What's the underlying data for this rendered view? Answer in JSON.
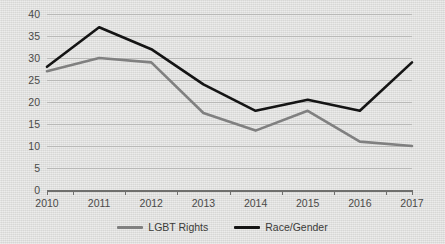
{
  "chart_data": {
    "type": "line",
    "title": "",
    "xlabel": "",
    "ylabel": "",
    "categories": [
      "2010",
      "2011",
      "2012",
      "2013",
      "2014",
      "2015",
      "2016",
      "2017"
    ],
    "series": [
      {
        "name": "LGBT Rights",
        "color": "#808080",
        "values": [
          27,
          30,
          29,
          17.5,
          13.5,
          18,
          11,
          10
        ]
      },
      {
        "name": "Race/Gender",
        "color": "#141414",
        "values": [
          28,
          37,
          32,
          24,
          18,
          20.5,
          18,
          29
        ]
      }
    ],
    "ylim": [
      0,
      40
    ],
    "ytick_labels": [
      "0",
      "5",
      "10",
      "15",
      "20",
      "25",
      "30",
      "35",
      "40"
    ],
    "ytick_values": [
      0,
      5,
      10,
      15,
      20,
      25,
      30,
      35,
      40
    ],
    "grid": true,
    "legend_position": "bottom"
  },
  "legend": {
    "items": [
      {
        "label": "LGBT Rights",
        "color": "#808080"
      },
      {
        "label": "Race/Gender",
        "color": "#141414"
      }
    ]
  }
}
